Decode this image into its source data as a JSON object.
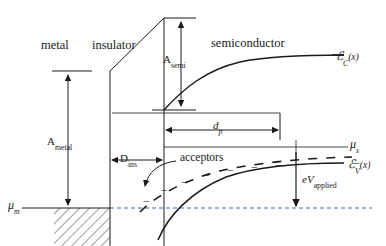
{
  "figure": {
    "background_color": "#ffffff",
    "line_color": "#1a1a1a",
    "width": 386,
    "height": 246
  },
  "regions": {
    "metal": "metal",
    "insulator": "insulator",
    "semiconductor": "semiconductor"
  },
  "labels": {
    "a_semi": {
      "base": "A",
      "sub": "semi"
    },
    "a_metal": {
      "base": "A",
      "sub": "metal"
    },
    "d_ins": {
      "base": "D",
      "sub": "ins"
    },
    "d_p": {
      "base": "d",
      "sub": "p"
    },
    "acceptors": "acceptors",
    "mu_m": {
      "base": "μ",
      "sub": "m"
    },
    "mu_s": {
      "base": "μ",
      "sub": "s"
    },
    "e_c": {
      "base": "ℰ",
      "sub": "C",
      "arg": "(x)"
    },
    "e_v": {
      "base": "ℰ",
      "sub": "V",
      "arg": "(x)"
    },
    "ev_applied": {
      "prefix": "e",
      "base": "V",
      "sub": "applied"
    }
  },
  "chart_data": {
    "type": "line",
    "xlabel": "x",
    "ylabel": "Energy",
    "grid": false,
    "legend": null,
    "axis_note": "Energy increases upward; x increases to the right",
    "boundaries": {
      "metal_insulator_x": 110,
      "insulator_semiconductor_x": 164,
      "depletion_edge_x": 280,
      "right_edge_x": 372
    },
    "levels": {
      "metal_fermi_mu_m": 208,
      "semiconductor_fermi_mu_s": 152,
      "metal_vacuum_top": 71,
      "insulator_top_left": 71,
      "insulator_top_right": 18,
      "semiconductor_Ec_at_interface": 108,
      "semiconductor_Ec_bulk": 56,
      "semiconductor_Ev_at_interface": 214,
      "semiconductor_Ev_bulk": 163,
      "acceptor_level_at_interface": 205,
      "acceptor_level_bulk": 158
    },
    "series": [
      {
        "name": "E_C(x) conduction band edge",
        "style": "solid",
        "points": [
          [
            164,
            108
          ],
          [
            176,
            96
          ],
          [
            190,
            85
          ],
          [
            206,
            75
          ],
          [
            224,
            67
          ],
          [
            244,
            61
          ],
          [
            266,
            58
          ],
          [
            292,
            56
          ],
          [
            320,
            56
          ],
          [
            372,
            56
          ]
        ]
      },
      {
        "name": "E_V(x) valence band edge",
        "style": "solid",
        "points": [
          [
            164,
            214
          ],
          [
            176,
            203
          ],
          [
            190,
            192
          ],
          [
            206,
            182
          ],
          [
            224,
            174
          ],
          [
            244,
            168
          ],
          [
            266,
            165
          ],
          [
            292,
            163
          ],
          [
            320,
            163
          ],
          [
            372,
            163
          ]
        ]
      },
      {
        "name": "acceptor level (dashed, ionized acceptors)",
        "style": "dashed",
        "points": [
          [
            164,
            205
          ],
          [
            176,
            194
          ],
          [
            190,
            184
          ],
          [
            206,
            174
          ],
          [
            224,
            166
          ],
          [
            244,
            160
          ],
          [
            266,
            158
          ],
          [
            292,
            157
          ],
          [
            320,
            157
          ],
          [
            372,
            157
          ]
        ]
      },
      {
        "name": "insulator conduction band edge (sloped)",
        "style": "solid",
        "points": [
          [
            110,
            71
          ],
          [
            164,
            18
          ]
        ]
      },
      {
        "name": "metal Fermi level mu_m (dashed extension)",
        "style": "dashed",
        "points": [
          [
            22,
            208
          ],
          [
            372,
            208
          ]
        ]
      }
    ],
    "annotations": [
      {
        "text": "A_semi",
        "type": "double-arrow-vertical",
        "x": 158,
        "y0": 18,
        "y1": 108
      },
      {
        "text": "A_metal",
        "type": "double-arrow-vertical",
        "x": 68,
        "y0": 71,
        "y1": 208
      },
      {
        "text": "D_ins",
        "type": "double-arrow-horizontal",
        "y": 160,
        "x0": 110,
        "x1": 164
      },
      {
        "text": "d_p",
        "type": "double-arrow-horizontal",
        "y": 127,
        "x0": 164,
        "x1": 280
      },
      {
        "text": "eV_applied",
        "type": "arrow-down",
        "x": 296,
        "y0": 152,
        "y1": 208
      },
      {
        "text": "acceptors",
        "type": "curved-arrow",
        "from": [
          176,
          163
        ],
        "to": [
          152,
          190
        ]
      }
    ],
    "acceptor_marks": {
      "symbol": "−",
      "count": 9,
      "positions": [
        [
          146,
          202
        ],
        [
          164,
          191
        ],
        [
          184,
          183
        ],
        [
          206,
          176
        ],
        [
          230,
          171
        ],
        [
          254,
          168
        ],
        [
          278,
          166
        ],
        [
          302,
          165
        ],
        [
          330,
          164
        ],
        [
          356,
          164
        ]
      ]
    }
  }
}
